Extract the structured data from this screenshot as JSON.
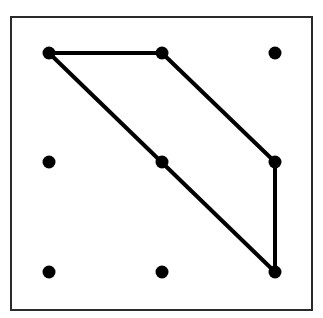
{
  "diagram": {
    "frame": {
      "x": 11,
      "y": 17,
      "width": 301,
      "height": 293,
      "stroke": "#2a2a2a"
    },
    "grid": {
      "cols_x": [
        49,
        162,
        275
      ],
      "rows_y": [
        53,
        162,
        272
      ],
      "dot_radius": 6.5,
      "dot_color": "#000000"
    },
    "dots": [
      {
        "id": "r0c0",
        "x": 49,
        "y": 53
      },
      {
        "id": "r0c1",
        "x": 162,
        "y": 53
      },
      {
        "id": "r0c2",
        "x": 275,
        "y": 53
      },
      {
        "id": "r1c0",
        "x": 49,
        "y": 162
      },
      {
        "id": "r1c1",
        "x": 162,
        "y": 162
      },
      {
        "id": "r1c2",
        "x": 275,
        "y": 162
      },
      {
        "id": "r2c0",
        "x": 49,
        "y": 272
      },
      {
        "id": "r2c1",
        "x": 162,
        "y": 272
      },
      {
        "id": "r2c2",
        "x": 275,
        "y": 272
      }
    ],
    "polygon": {
      "vertices": [
        "r0c0",
        "r0c1",
        "r1c2",
        "r2c2"
      ],
      "points": [
        [
          49,
          53
        ],
        [
          162,
          53
        ],
        [
          275,
          162
        ],
        [
          275,
          272
        ]
      ],
      "stroke": "#000000",
      "stroke_width": 4
    }
  }
}
